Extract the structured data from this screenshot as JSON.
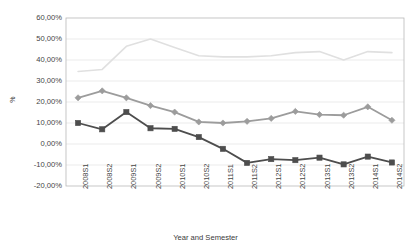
{
  "chart_data": {
    "type": "line",
    "title": "",
    "xlabel": "Year and Semester",
    "ylabel": "%",
    "categories": [
      "2008S1",
      "2008S2",
      "2009S1",
      "2009S2",
      "2010S1",
      "2010S2",
      "2011S1",
      "2011S2",
      "2012S1",
      "2012S2",
      "2013S1",
      "2013S2",
      "2014S1",
      "2014S2"
    ],
    "ylim": [
      -20,
      60
    ],
    "ytick_labels": [
      "60,00%",
      "50,00%",
      "40,00%",
      "30,00%",
      "20,00%",
      "10,00%",
      "0,00%",
      "-10,00%",
      "-20,00%"
    ],
    "ytick_values": [
      60,
      50,
      40,
      30,
      20,
      10,
      0,
      -10,
      -20
    ],
    "grid": true,
    "legend_position": "none",
    "series": [
      {
        "name": "series-light",
        "color": "#e0e0e0",
        "marker": "none",
        "values": [
          34.5,
          35.5,
          46.5,
          50.0,
          46.0,
          42.0,
          41.5,
          41.5,
          42.0,
          43.5,
          44.0,
          40.0,
          44.0,
          43.5
        ]
      },
      {
        "name": "series-mid",
        "color": "#9c9c9c",
        "marker": "diamond",
        "values": [
          22.0,
          25.3,
          22.0,
          18.3,
          15.2,
          10.5,
          10.0,
          10.8,
          12.2,
          15.5,
          14.0,
          13.7,
          17.7,
          11.3
        ]
      },
      {
        "name": "series-dark",
        "color": "#4d4d4d",
        "marker": "square",
        "values": [
          10.0,
          7.0,
          15.2,
          7.5,
          7.2,
          3.3,
          -2.3,
          -9.0,
          -7.2,
          -7.7,
          -6.5,
          -9.7,
          -6.0,
          -8.8
        ]
      }
    ]
  },
  "axes": {
    "y_axis_title": "%",
    "x_axis_title": "Year and Semester"
  }
}
